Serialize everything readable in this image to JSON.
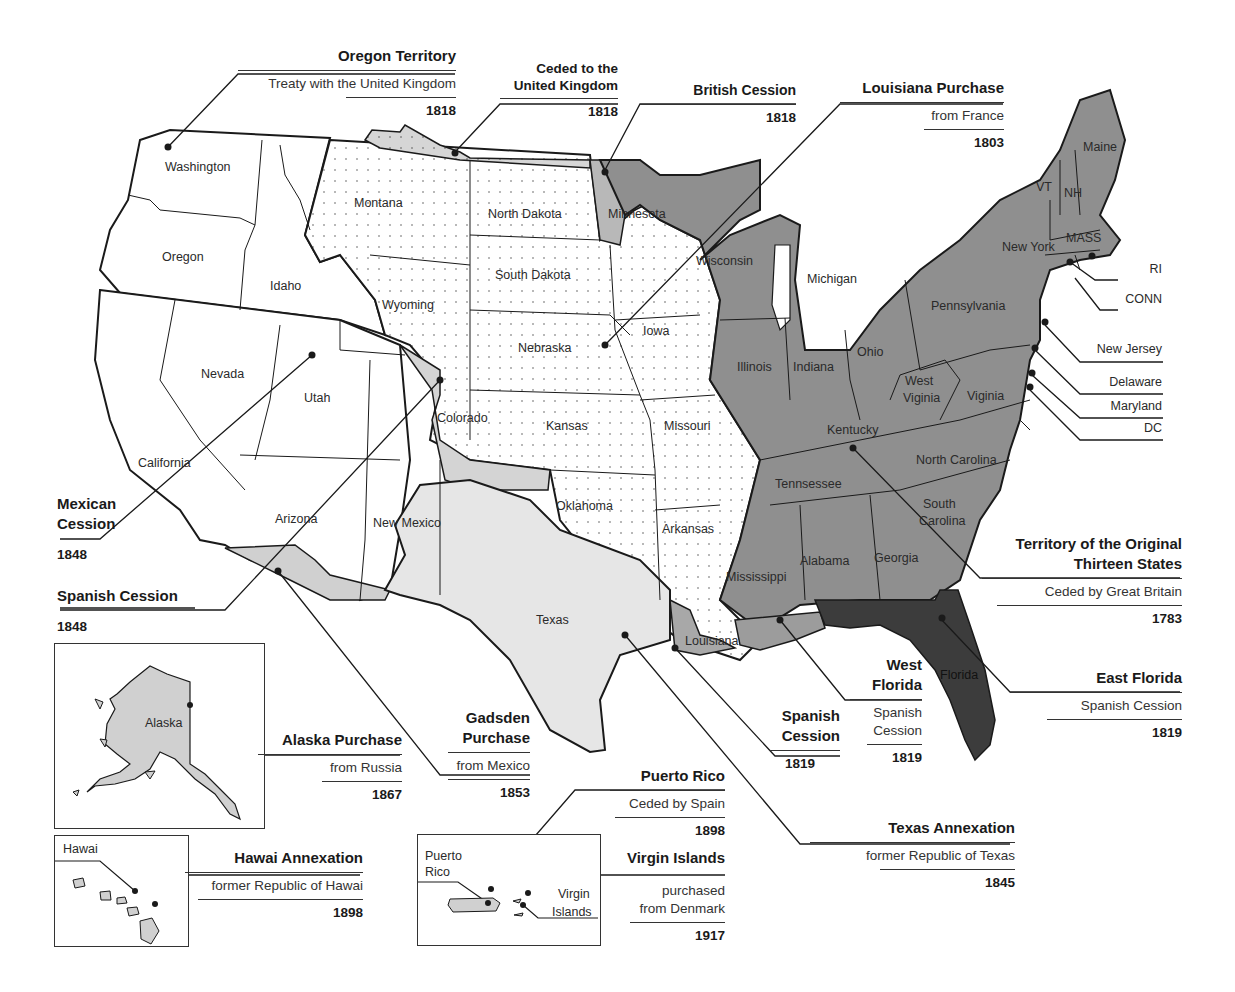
{
  "colors": {
    "original_13": "#8f8f8f",
    "louisiana_purchase": "#ffffff",
    "louisiana_purchase_dots": "#9a9a9a",
    "mexican_cession": "#ffffff",
    "oregon_territory": "#ffffff",
    "texas_annexation": "#e6e6e6",
    "british_cession": "#b8b8b8",
    "spanish_cession_1848": "#d4d4d4",
    "east_florida": "#3c3c3c",
    "west_florida": "#9c9c9c",
    "gadsden": "#d0d0d0",
    "alaska": "#d0d0d0",
    "borders": "#1a1a1a"
  },
  "callouts": {
    "oregon": {
      "title": "Oregon Territory",
      "sub": "Treaty with the United Kingdom",
      "year": "1818"
    },
    "ceded_uk": {
      "title_line1": "Ceded to the",
      "title_line2": "United Kingdom",
      "year": "1818"
    },
    "british_cession": {
      "title": "British Cession",
      "year": "1818"
    },
    "louisiana": {
      "title": "Louisiana Purchase",
      "sub": "from France",
      "year": "1803"
    },
    "mexican": {
      "title_line1": "Mexican",
      "title_line2": "Cession",
      "year": "1848"
    },
    "spanish_1848": {
      "title": "Spanish Cession",
      "year": "1848"
    },
    "original_13": {
      "title_line1": "Territory of the Original",
      "title_line2": "Thirteen States",
      "sub": "Ceded by Great Britain",
      "year": "1783"
    },
    "east_florida": {
      "title": "East Florida",
      "sub": "Spanish Cession",
      "year": "1819"
    },
    "west_florida": {
      "title_line1": "West",
      "title_line2": "Florida",
      "sub_line1": "Spanish",
      "sub_line2": "Cession",
      "year": "1819"
    },
    "spanish_1819": {
      "title_line1": "Spanish",
      "title_line2": "Cession",
      "year": "1819"
    },
    "alaska": {
      "title": "Alaska Purchase",
      "sub": "from Russia",
      "year": "1867"
    },
    "gadsden": {
      "title_line1": "Gadsden",
      "title_line2": "Purchase",
      "sub": "from Mexico",
      "year": "1853"
    },
    "hawaii": {
      "title": "Hawai Annexation",
      "sub": "former Republic of Hawai",
      "year": "1898"
    },
    "puerto_rico": {
      "title": "Puerto Rico",
      "sub": "Ceded by Spain",
      "year": "1898"
    },
    "virgin_islands": {
      "title": "Virgin Islands",
      "sub_line1": "purchased",
      "sub_line2": "from Denmark",
      "year": "1917"
    },
    "texas": {
      "title": "Texas Annexation",
      "sub": "former Republic of Texas",
      "year": "1845"
    }
  },
  "small_state_labels": {
    "ri": "RI",
    "conn": "CONN",
    "new_jersey": "New Jersey",
    "delaware": "Delaware",
    "maryland": "Maryland",
    "dc": "DC"
  },
  "states": {
    "washington": "Washington",
    "oregon": "Oregon",
    "idaho": "Idaho",
    "montana": "Montana",
    "wyoming": "Wyoming",
    "north_dakota": "North Dakota",
    "south_dakota": "South Dakota",
    "minnesota": "Minnesota",
    "nebraska": "Nebraska",
    "iowa": "Iowa",
    "nevada": "Nevada",
    "utah": "Utah",
    "california": "California",
    "colorado": "Colorado",
    "kansas": "Kansas",
    "missouri": "Missouri",
    "arizona": "Arizona",
    "new_mexico": "New Mexico",
    "oklahoma": "Oklahoma",
    "arkansas": "Arkansas",
    "texas": "Texas",
    "louisiana": "Louisiana",
    "wisconsin": "Wisconsin",
    "michigan": "Michigan",
    "illinois": "Illinois",
    "indiana": "Indiana",
    "ohio": "Ohio",
    "kentucky": "Kentucky",
    "tennessee": "Tennsessee",
    "mississippi": "Mississippi",
    "alabama": "Alabama",
    "georgia": "Georgia",
    "florida": "Florida",
    "south_carolina_1": "South",
    "south_carolina_2": "Carolina",
    "north_carolina": "North Carolina",
    "virginia": "Viginia",
    "west_virginia_1": "West",
    "west_virginia_2": "Viginia",
    "pennsylvania": "Pennsylvania",
    "new_york": "New York",
    "vt": "VT",
    "nh": "NH",
    "maine": "Maine",
    "mass": "MASS"
  },
  "insets": {
    "alaska_label": "Alaska",
    "hawaii_label": "Hawai",
    "puerto_rico_label_1": "Puerto",
    "puerto_rico_label_2": "Rico",
    "virgin_islands_label_1": "Virgin",
    "virgin_islands_label_2": "Islands"
  }
}
